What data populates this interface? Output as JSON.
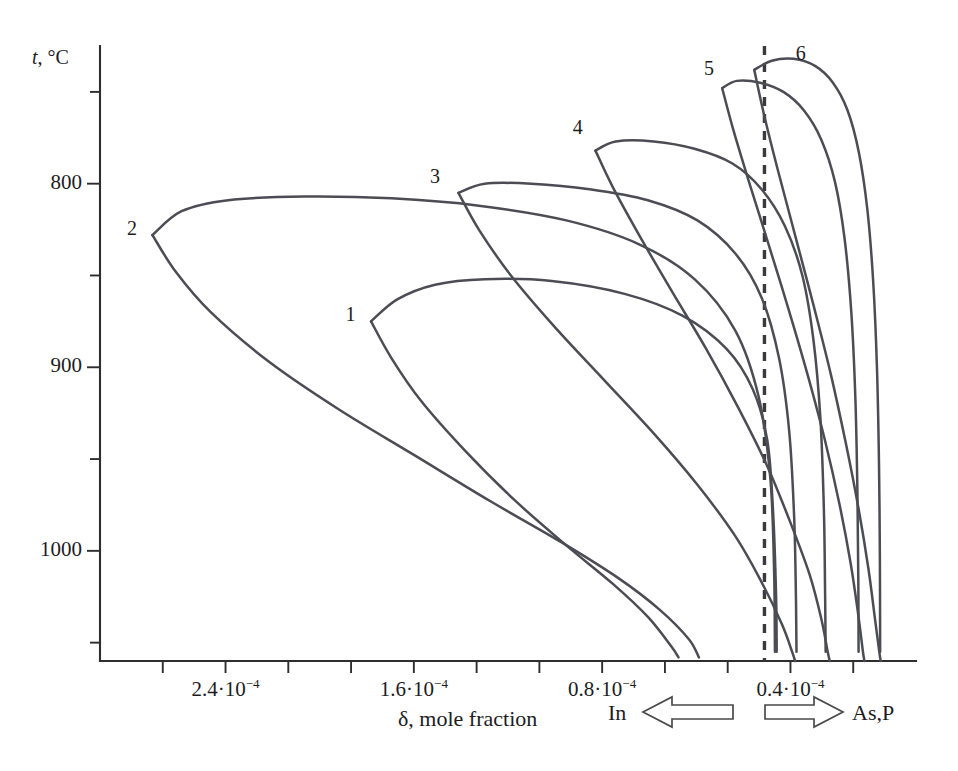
{
  "figure": {
    "background_color": "#ffffff",
    "curve_color": "#4c4c54",
    "axis_color": "#2e2e30"
  },
  "axes": {
    "y": {
      "label_symbol": "t",
      "label_unit": ", °C",
      "label_full": "t, °C",
      "major_ticks": [
        "1000",
        "900",
        "800"
      ],
      "major_values": [
        1000,
        900,
        800
      ],
      "minor_values": [
        1050,
        950,
        850,
        750
      ],
      "range": [
        740,
        1075
      ]
    },
    "x": {
      "title": "δ, mole fraction",
      "tick_labels": [
        "2.4·10⁻⁴",
        "1.6·10⁻⁴",
        "0.8·10⁻⁴",
        "0.4·10⁻⁴"
      ],
      "tick_mantissas": [
        "2.4",
        "1.6",
        "0.8",
        "0.4"
      ],
      "tick_exponent": "−4",
      "tick_base": "·10",
      "tick_values": [
        0.00024,
        0.00016,
        8e-05,
        4e-05
      ],
      "direction": "reversed",
      "range": [
        0.00028,
        0.0
      ]
    }
  },
  "direction_markers": [
    {
      "label": "In",
      "arrow": "left-arrow-icon",
      "side": "left"
    },
    {
      "label": "As,P",
      "arrow": "right-arrow-icon",
      "side": "right"
    }
  ],
  "reference_line": {
    "name": "dashed-reference-line",
    "style": "dashed",
    "x_value": 5.2e-05
  },
  "curve_labels": [
    "1",
    "2",
    "3",
    "4",
    "5",
    "6"
  ],
  "chart_data": {
    "type": "line",
    "title": "",
    "subtitle": "",
    "xlabel": "δ, mole fraction",
    "ylabel": "t, °C",
    "xlim": [
      0.00028,
      0.0
    ],
    "ylim": [
      740,
      1075
    ],
    "grid": false,
    "legend": "inline curve numbers",
    "x_tick_labels": [
      "2.4·10⁻⁴",
      "1.6·10⁻⁴",
      "0.8·10⁻⁴",
      "0.4·10⁻⁴"
    ],
    "x_ticks": [
      0.00024,
      0.00016,
      8e-05,
      4e-05
    ],
    "y_ticks": [
      800,
      900,
      1000
    ],
    "y_minor_ticks": [
      750,
      850,
      950,
      1050
    ],
    "annotations": [
      "1",
      "2",
      "3",
      "4",
      "5",
      "6",
      "In",
      "As,P"
    ],
    "series": [
      {
        "name": "1",
        "label_position": {
          "x": 0.000193,
          "y": 928
        },
        "nose_temperature": 925,
        "nose_delta": 0.000187,
        "max_temperature": 947,
        "upper_branch": [
          [
            0.000187,
            925
          ],
          [
            0.000178,
            937
          ],
          [
            0.000165,
            945
          ],
          [
            0.000148,
            948
          ],
          [
            0.000125,
            947
          ],
          [
            0.0001,
            940
          ],
          [
            8e-05,
            928
          ],
          [
            6.5e-05,
            910
          ],
          [
            5.6e-05,
            888
          ],
          [
            5.1e-05,
            860
          ],
          [
            4.9e-05,
            820
          ],
          [
            4.8e-05,
            775
          ],
          [
            4.78e-05,
            745
          ]
        ],
        "lower_branch": [
          [
            0.000187,
            925
          ],
          [
            0.00018,
            905
          ],
          [
            0.00017,
            882
          ],
          [
            0.000155,
            855
          ],
          [
            0.000138,
            828
          ],
          [
            0.00012,
            803
          ],
          [
            0.000104,
            782
          ],
          [
            9.2e-05,
            764
          ],
          [
            8.4e-05,
            748
          ],
          [
            8.15e-05,
            742
          ]
        ]
      },
      {
        "name": "2",
        "label_position": {
          "x": 0.000268,
          "y": 975
        },
        "nose_temperature": 972,
        "nose_delta": 0.000262,
        "max_temperature": 993,
        "upper_branch": [
          [
            0.000262,
            972
          ],
          [
            0.000252,
            985
          ],
          [
            0.000236,
            991
          ],
          [
            0.00021,
            993
          ],
          [
            0.00018,
            992
          ],
          [
            0.00015,
            988
          ],
          [
            0.00012,
            980
          ],
          [
            9.5e-05,
            967
          ],
          [
            7.6e-05,
            948
          ],
          [
            6.2e-05,
            920
          ],
          [
            5.4e-05,
            884
          ],
          [
            5e-05,
            840
          ],
          [
            4.87e-05,
            790
          ],
          [
            4.84e-05,
            745
          ]
        ],
        "lower_branch": [
          [
            0.000262,
            972
          ],
          [
            0.000254,
            952
          ],
          [
            0.000242,
            930
          ],
          [
            0.000222,
            903
          ],
          [
            0.000198,
            877
          ],
          [
            0.000172,
            852
          ],
          [
            0.000146,
            827
          ],
          [
            0.000122,
            805
          ],
          [
            0.000102,
            785
          ],
          [
            8.8e-05,
            768
          ],
          [
            7.8e-05,
            752
          ],
          [
            7.45e-05,
            742
          ]
        ]
      },
      {
        "name": "3",
        "label_position": {
          "x": 0.000164,
          "y": 1003
        },
        "nose_temperature": 995,
        "nose_delta": 0.000157,
        "max_temperature": 1000,
        "upper_branch": [
          [
            0.000157,
            995
          ],
          [
            0.000148,
            1000
          ],
          [
            0.000132,
            1000
          ],
          [
            0.000112,
            997
          ],
          [
            9.2e-05,
            991
          ],
          [
            7.5e-05,
            980
          ],
          [
            6.2e-05,
            962
          ],
          [
            5.3e-05,
            938
          ],
          [
            4.7e-05,
            905
          ],
          [
            4.35e-05,
            865
          ],
          [
            4.18e-05,
            818
          ],
          [
            4.12e-05,
            775
          ],
          [
            4.1e-05,
            745
          ]
        ],
        "lower_branch": [
          [
            0.000157,
            995
          ],
          [
            0.00015,
            975
          ],
          [
            0.000139,
            950
          ],
          [
            0.000124,
            922
          ],
          [
            0.000107,
            893
          ],
          [
            9e-05,
            864
          ],
          [
            7.5e-05,
            836
          ],
          [
            6.2e-05,
            808
          ],
          [
            5.3e-05,
            783
          ],
          [
            4.6e-05,
            760
          ],
          [
            4.25e-05,
            745
          ],
          [
            4.15e-05,
            740
          ]
        ]
      },
      {
        "name": "4",
        "label_position": {
          "x": 0.000115,
          "y": 1030
        },
        "nose_temperature": 1018,
        "nose_delta": 0.00011,
        "max_temperature": 1023,
        "upper_branch": [
          [
            0.00011,
            1018
          ],
          [
            0.000103,
            1023
          ],
          [
            9e-05,
            1023
          ],
          [
            7.6e-05,
            1019
          ],
          [
            6.3e-05,
            1011
          ],
          [
            5.3e-05,
            997
          ],
          [
            4.5e-05,
            977
          ],
          [
            3.9e-05,
            950
          ],
          [
            3.52e-05,
            915
          ],
          [
            3.28e-05,
            872
          ],
          [
            3.16e-05,
            822
          ],
          [
            3.12e-05,
            778
          ],
          [
            3.1e-05,
            745
          ]
        ],
        "lower_branch": [
          [
            0.00011,
            1018
          ],
          [
            0.000104,
            998
          ],
          [
            9.5e-05,
            972
          ],
          [
            8.4e-05,
            942
          ],
          [
            7.2e-05,
            910
          ],
          [
            6.1e-05,
            878
          ],
          [
            5.1e-05,
            846
          ],
          [
            4.3e-05,
            815
          ],
          [
            3.65e-05,
            787
          ],
          [
            3.25e-05,
            763
          ],
          [
            3.03e-05,
            745
          ],
          [
            2.96e-05,
            740
          ]
        ]
      },
      {
        "name": "5",
        "label_position": {
          "x": 7e-05,
          "y": 1062
        },
        "nose_temperature": 1052,
        "nose_delta": 6.65e-05,
        "max_temperature": 1056,
        "upper_branch": [
          [
            6.65e-05,
            1052
          ],
          [
            6.15e-05,
            1056
          ],
          [
            5.35e-05,
            1055
          ],
          [
            4.55e-05,
            1050
          ],
          [
            3.85e-05,
            1040
          ],
          [
            3.25e-05,
            1024
          ],
          [
            2.78e-05,
            1001
          ],
          [
            2.45e-05,
            970
          ],
          [
            2.22e-05,
            930
          ],
          [
            2.08e-05,
            883
          ],
          [
            2.01e-05,
            832
          ],
          [
            1.98e-05,
            785
          ],
          [
            1.97e-05,
            745
          ]
        ],
        "lower_branch": [
          [
            6.65e-05,
            1052
          ],
          [
            6.28e-05,
            1030
          ],
          [
            5.75e-05,
            1002
          ],
          [
            5.08e-05,
            968
          ],
          [
            4.38e-05,
            932
          ],
          [
            3.72e-05,
            896
          ],
          [
            3.12e-05,
            860
          ],
          [
            2.62e-05,
            825
          ],
          [
            2.24e-05,
            793
          ],
          [
            1.98e-05,
            765
          ],
          [
            1.82e-05,
            745
          ],
          [
            1.77e-05,
            740
          ]
        ]
      },
      {
        "name": "6",
        "label_position": {
          "x": 3.85e-05,
          "y": 1070
        },
        "nose_temperature": 1062,
        "nose_delta": 5.55e-05,
        "max_temperature": 1068,
        "upper_branch": [
          [
            5.55e-05,
            1062
          ],
          [
            4.95e-05,
            1067
          ],
          [
            4.2e-05,
            1068
          ],
          [
            3.45e-05,
            1064
          ],
          [
            2.85e-05,
            1055
          ],
          [
            2.35e-05,
            1040
          ],
          [
            1.96e-05,
            1017
          ],
          [
            1.67e-05,
            986
          ],
          [
            1.47e-05,
            947
          ],
          [
            1.34e-05,
            900
          ],
          [
            1.27e-05,
            848
          ],
          [
            1.24e-05,
            797
          ],
          [
            1.23e-05,
            745
          ]
        ],
        "lower_branch": [
          [
            5.55e-05,
            1062
          ],
          [
            5.22e-05,
            1038
          ],
          [
            4.75e-05,
            1008
          ],
          [
            4.15e-05,
            972
          ],
          [
            3.52e-05,
            934
          ],
          [
            2.92e-05,
            896
          ],
          [
            2.4e-05,
            858
          ],
          [
            1.96e-05,
            822
          ],
          [
            1.63e-05,
            790
          ],
          [
            1.4e-05,
            762
          ],
          [
            1.26e-05,
            745
          ],
          [
            1.21e-05,
            740
          ]
        ]
      }
    ]
  }
}
